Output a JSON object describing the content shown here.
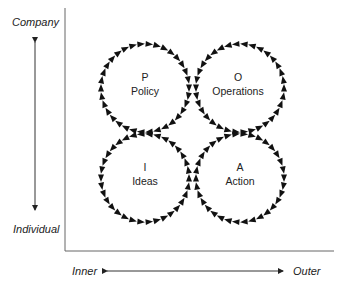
{
  "axes": {
    "y_top_label": "Company",
    "y_bottom_label": "Individual",
    "x_left_label": "Inner",
    "x_right_label": "Outer"
  },
  "quadrants": [
    {
      "id": "policy",
      "letter": "P",
      "name": "Policy",
      "position": "top-left",
      "flow": "clockwise"
    },
    {
      "id": "operations",
      "letter": "O",
      "name": "Operations",
      "position": "top-right",
      "flow": "counter-clockwise"
    },
    {
      "id": "ideas",
      "letter": "I",
      "name": "Ideas",
      "position": "bottom-left",
      "flow": "counter-clockwise"
    },
    {
      "id": "action",
      "letter": "A",
      "name": "Action",
      "position": "bottom-right",
      "flow": "clockwise"
    }
  ],
  "colors": {
    "arrow": "#111111",
    "axis": "#555555",
    "text": "#222222"
  }
}
